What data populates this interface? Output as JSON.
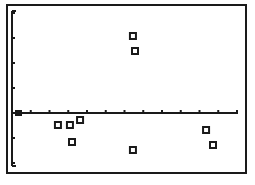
{
  "chart_data": {
    "type": "scatter",
    "title": "",
    "xlabel": "",
    "ylabel": "",
    "grid": false,
    "legend": null,
    "marker": "hollow-square",
    "axis_origin_marker": "filled-square",
    "xlim": [
      0,
      12
    ],
    "ylim": [
      -2.1,
      4.1
    ],
    "x_tick_step": 1,
    "y_tick_step": 1,
    "x_ticks": [
      0,
      1,
      2,
      3,
      4,
      5,
      6,
      7,
      8,
      9,
      10,
      11,
      12
    ],
    "y_ticks": [
      -2,
      -1,
      0,
      1,
      2,
      3,
      4
    ],
    "points": [
      {
        "x": 2.45,
        "y": -0.48
      },
      {
        "x": 3.09,
        "y": -0.48
      },
      {
        "x": 3.63,
        "y": -0.28
      },
      {
        "x": 3.2,
        "y": -1.16
      },
      {
        "x": 6.45,
        "y": 3.08
      },
      {
        "x": 6.56,
        "y": 2.48
      },
      {
        "x": 6.45,
        "y": -1.48
      },
      {
        "x": 10.35,
        "y": -0.68
      },
      {
        "x": 10.72,
        "y": -1.28
      }
    ]
  },
  "layout": {
    "frame": {
      "x": 7,
      "y": 5,
      "w": 239,
      "h": 168
    },
    "origin_px": {
      "x": 12,
      "y": 113
    },
    "x_unit_px": 18.75,
    "y_unit_px": 25,
    "y_axis_top": 11,
    "y_axis_bottom": 166,
    "x_axis_right": 238
  },
  "colors": {
    "foreground": "#1a1a1a",
    "background": "#ffffff"
  }
}
